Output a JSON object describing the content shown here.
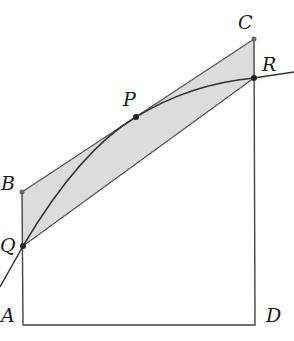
{
  "diagram": {
    "points": {
      "A": {
        "label": "A",
        "x": 23,
        "y": 325
      },
      "B": {
        "label": "B",
        "x": 22,
        "y": 192
      },
      "C": {
        "label": "C",
        "x": 254,
        "y": 39
      },
      "D": {
        "label": "D",
        "x": 255,
        "y": 325
      },
      "P": {
        "label": "P",
        "x": 136,
        "y": 117
      },
      "Q": {
        "label": "Q",
        "x": 23,
        "y": 246
      },
      "R": {
        "label": "R",
        "x": 254,
        "y": 78
      }
    },
    "colors": {
      "stroke": "#333333",
      "fill": "#dcdcdc",
      "dot": "#222222",
      "label": "#1a1a1a"
    }
  }
}
